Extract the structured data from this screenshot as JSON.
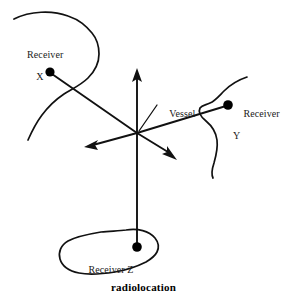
{
  "figure": {
    "caption": "radiolocation",
    "kind": "radiolocation-diagram"
  },
  "labels": {
    "receiver_x": {
      "line1": "Receiver",
      "line2": "X"
    },
    "receiver_y": {
      "line1": "Receiver",
      "line2": "Y"
    },
    "receiver_z": {
      "line1": "Receiver Z",
      "line2": ""
    },
    "vessel": {
      "line1": "Vessel",
      "line2": ""
    }
  },
  "colors": {
    "ink": "#111111",
    "background": "#ffffff",
    "text": "#1a1a1a",
    "caption": "#000000"
  },
  "geometry": {
    "vessel_point": {
      "x": 137,
      "y": 133
    },
    "receivers": [
      {
        "id": "X",
        "dot": {
          "x": 50,
          "y": 72
        }
      },
      {
        "id": "Y",
        "dot": {
          "x": 228,
          "y": 105
        }
      },
      {
        "id": "Z",
        "dot": {
          "x": 137,
          "y": 247
        }
      }
    ],
    "direction_arrows": [
      {
        "id": "north-arrow",
        "tip": {
          "x": 137,
          "y": 69
        }
      },
      {
        "id": "west-arrow",
        "tip": {
          "x": 85,
          "y": 147
        }
      },
      {
        "id": "southeast-arrow",
        "tip": {
          "x": 176,
          "y": 159
        }
      }
    ]
  }
}
